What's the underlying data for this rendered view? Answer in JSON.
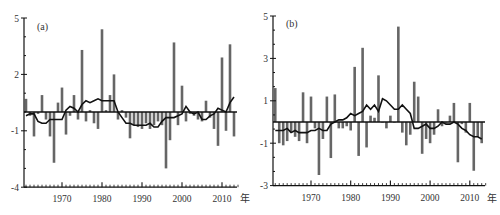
{
  "chart_data": [
    {
      "type": "bar",
      "panel_label": "(a)",
      "title": "",
      "xlabel": "年",
      "ylabel": "",
      "ylim": [
        -4,
        5
      ],
      "yticks": [
        5,
        2,
        -1,
        -4
      ],
      "xticks": [
        1970,
        1980,
        1990,
        2000,
        2010
      ],
      "xrange": [
        1960.5,
        2014
      ],
      "grid": false,
      "legend": "none",
      "categories": [
        1961,
        1962,
        1963,
        1964,
        1965,
        1966,
        1967,
        1968,
        1969,
        1970,
        1971,
        1972,
        1973,
        1974,
        1975,
        1976,
        1977,
        1978,
        1979,
        1980,
        1981,
        1982,
        1983,
        1984,
        1985,
        1986,
        1987,
        1988,
        1989,
        1990,
        1991,
        1992,
        1993,
        1994,
        1995,
        1996,
        1997,
        1998,
        1999,
        2000,
        2001,
        2002,
        2003,
        2004,
        2005,
        2006,
        2007,
        2008,
        2009,
        2010,
        2011,
        2012,
        2013
      ],
      "series": [
        {
          "name": "anomaly",
          "kind": "bar",
          "color": "#666666",
          "values": [
            0.7,
            -0.2,
            -1.3,
            -0.1,
            0.9,
            -0.4,
            -1.3,
            -2.7,
            0.5,
            1.3,
            -1.2,
            -0.2,
            0.9,
            -0.4,
            3.3,
            -0.5,
            0.1,
            -0.6,
            -0.9,
            4.4,
            0.1,
            0.9,
            2.0,
            -0.4,
            0.1,
            -0.3,
            -1.4,
            -0.7,
            -0.8,
            -0.9,
            -0.6,
            -0.9,
            -0.7,
            -0.5,
            -0.7,
            -3.0,
            -1.5,
            3.7,
            -0.7,
            1.4,
            -0.5,
            -0.1,
            -0.2,
            -0.4,
            -0.5,
            0.6,
            -0.3,
            -0.9,
            -1.8,
            2.9,
            -1.0,
            3.6,
            -1.3
          ]
        },
        {
          "name": "moving-average",
          "kind": "line",
          "color": "#111111",
          "values": [
            -0.2,
            -0.1,
            -0.1,
            -0.5,
            -0.6,
            -0.6,
            -0.4,
            -0.4,
            -0.4,
            -0.4,
            0.1,
            0.3,
            0.2,
            0.0,
            0.4,
            0.6,
            0.5,
            0.6,
            0.7,
            0.6,
            0.6,
            0.6,
            0.6,
            0.0,
            -0.3,
            -0.6,
            -0.6,
            -0.7,
            -0.7,
            -0.7,
            -0.7,
            -0.6,
            -0.8,
            -0.8,
            -0.5,
            -0.3,
            -0.3,
            -0.3,
            -0.2,
            -0.1,
            0.3,
            0.0,
            -0.1,
            0.0,
            -0.4,
            -0.4,
            -0.2,
            -0.1,
            0.2,
            0.1,
            0.0,
            0.5,
            0.8
          ]
        }
      ]
    },
    {
      "type": "bar",
      "panel_label": "(b)",
      "title": "",
      "xlabel": "年",
      "ylabel": "",
      "ylim": [
        -3,
        5
      ],
      "yticks": [
        5,
        3,
        1,
        -1,
        -3
      ],
      "xticks": [
        1970,
        1980,
        1990,
        2000,
        2010
      ],
      "xrange": [
        1960.5,
        2014
      ],
      "grid": false,
      "legend": "none",
      "categories": [
        1961,
        1962,
        1963,
        1964,
        1965,
        1966,
        1967,
        1968,
        1969,
        1970,
        1971,
        1972,
        1973,
        1974,
        1975,
        1976,
        1977,
        1978,
        1979,
        1980,
        1981,
        1982,
        1983,
        1984,
        1985,
        1986,
        1987,
        1988,
        1989,
        1990,
        1991,
        1992,
        1993,
        1994,
        1995,
        1996,
        1997,
        1998,
        1999,
        2000,
        2001,
        2002,
        2003,
        2004,
        2005,
        2006,
        2007,
        2008,
        2009,
        2010,
        2011,
        2012,
        2013
      ],
      "series": [
        {
          "name": "anomaly",
          "kind": "bar",
          "color": "#666666",
          "values": [
            1.6,
            -1.0,
            -1.1,
            -0.9,
            -0.5,
            -0.7,
            -0.9,
            1.4,
            -1.0,
            1.2,
            -0.3,
            -2.5,
            -0.8,
            1.2,
            -1.7,
            1.3,
            -0.3,
            -0.3,
            -0.2,
            -0.4,
            2.6,
            -1.6,
            3.5,
            -1.2,
            0.3,
            0.2,
            2.2,
            0.0,
            -0.3,
            0.3,
            0.0,
            4.5,
            -0.5,
            -1.1,
            -0.6,
            1.9,
            1.2,
            -1.5,
            -0.8,
            -1.0,
            -0.6,
            0.6,
            -0.2,
            0.0,
            0.3,
            0.9,
            -1.9,
            -0.1,
            -0.5,
            0.9,
            -2.3,
            -0.7,
            -1.0
          ]
        },
        {
          "name": "moving-average",
          "kind": "line",
          "color": "#111111",
          "values": [
            -0.4,
            -0.4,
            -0.4,
            -0.3,
            -0.5,
            -0.4,
            -0.5,
            -0.5,
            -0.5,
            -0.4,
            -0.4,
            -0.3,
            -0.4,
            -0.4,
            -0.1,
            0.0,
            0.1,
            0.1,
            0.2,
            0.4,
            0.3,
            0.4,
            0.5,
            0.8,
            0.6,
            0.8,
            0.5,
            1.1,
            1.0,
            0.8,
            0.6,
            0.6,
            0.8,
            0.6,
            0.4,
            -0.3,
            -0.3,
            -0.2,
            -0.1,
            -0.3,
            -0.3,
            -0.2,
            0.0,
            -0.1,
            -0.1,
            0.0,
            -0.1,
            -0.3,
            -0.4,
            -0.6,
            -0.7,
            -0.7,
            -0.8
          ]
        }
      ]
    }
  ],
  "panels": [
    {
      "label": "(a)",
      "y_tick_labels": [
        "5",
        "2",
        "-1",
        "-4"
      ],
      "x_tick_labels": [
        "1970",
        "1980",
        "1990",
        "2000",
        "2010"
      ],
      "x_unit": "年"
    },
    {
      "label": "(b)",
      "y_tick_labels": [
        "5",
        "3",
        "1",
        "-1",
        "-3"
      ],
      "x_tick_labels": [
        "1970",
        "1980",
        "1990",
        "2000",
        "2010"
      ],
      "x_unit": "年"
    }
  ]
}
